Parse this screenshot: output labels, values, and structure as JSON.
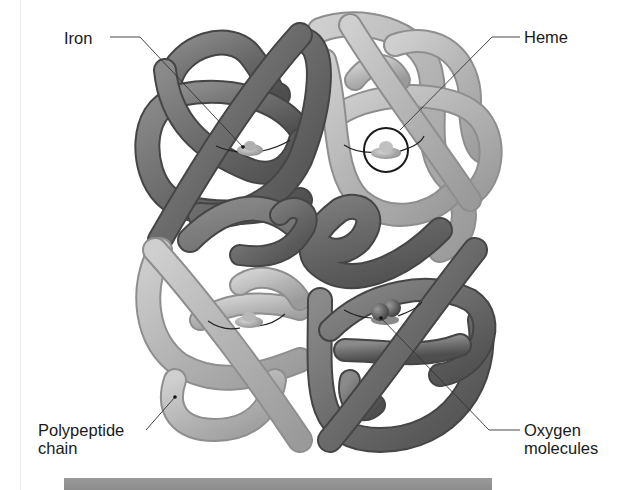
{
  "figure": {
    "labels": {
      "iron": "Iron",
      "heme": "Heme",
      "polypeptide_line1": "Polypeptide",
      "polypeptide_line2": "chain",
      "oxygen_line1": "Oxygen",
      "oxygen_line2": "molecules"
    },
    "subunits": [
      {
        "position": "top-left",
        "shade": "dark",
        "color": "#6e6e6e",
        "bound": "iron"
      },
      {
        "position": "top-right",
        "shade": "light",
        "color": "#b4b4b4",
        "bound": "heme"
      },
      {
        "position": "bottom-left",
        "shade": "light",
        "color": "#b4b4b4",
        "bound": "heme"
      },
      {
        "position": "bottom-right",
        "shade": "dark",
        "color": "#6e6e6e",
        "bound": "oxygen"
      }
    ],
    "colors": {
      "dark_chain": "#6e6e6e",
      "light_chain": "#b4b4b4",
      "leader_line": "#333333",
      "caption_bar": "#939393"
    }
  }
}
